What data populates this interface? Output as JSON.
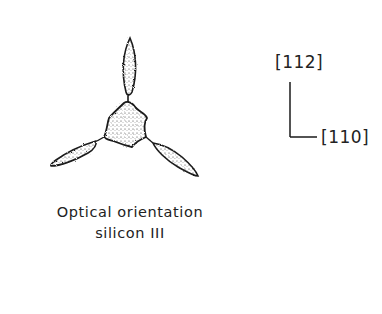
{
  "figure": {
    "caption": {
      "line1": "Optical orientation",
      "line2": "silicon III"
    },
    "axes": {
      "vertical_label": "[112]",
      "horizontal_label": "[110]"
    },
    "colors": {
      "ink": "#1a1a1a",
      "background": "#ffffff"
    }
  }
}
